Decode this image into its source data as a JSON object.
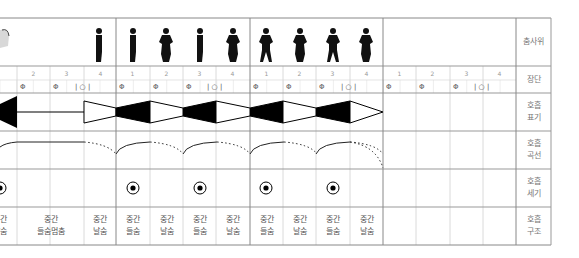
{
  "row_labels": [
    {
      "id": "dance-pose",
      "text": "춤사위"
    },
    {
      "id": "jangdan",
      "text": "장단"
    },
    {
      "id": "breath-notation",
      "text": "호흡\n표기"
    },
    {
      "id": "breath-curve",
      "text": "호흡\n곡선"
    },
    {
      "id": "breath-intensity",
      "text": "호흡\n세기"
    },
    {
      "id": "breath-structure",
      "text": "호흡\n구조"
    }
  ],
  "measures": [
    {
      "beats": [
        "2",
        "3",
        "4"
      ],
      "symbols": [
        "Φ",
        "Φ",
        "| ○ |"
      ]
    },
    {
      "beats": [
        "1",
        "2",
        "3",
        "4"
      ],
      "symbols": [
        "Φ",
        "Φ",
        "Φ",
        "| ○ |"
      ]
    },
    {
      "beats": [
        "1",
        "2",
        "3",
        "4"
      ],
      "symbols": [
        "Φ",
        "Φ",
        "Φ",
        "| ○ |"
      ]
    },
    {
      "beats": [
        "1",
        "2",
        "3",
        "4"
      ],
      "symbols": [
        "Φ",
        "Φ",
        "Φ",
        "| ○ |"
      ]
    }
  ],
  "beat_numbers": [
    {
      "x": 17,
      "t": "2"
    },
    {
      "x": 50,
      "t": "3"
    },
    {
      "x": 84,
      "t": "4"
    },
    {
      "x": 116,
      "t": "1"
    },
    {
      "x": 150,
      "t": "2"
    },
    {
      "x": 183,
      "t": "3"
    },
    {
      "x": 216,
      "t": "4"
    },
    {
      "x": 250,
      "t": "1"
    },
    {
      "x": 283,
      "t": "2"
    },
    {
      "x": 316,
      "t": "3"
    },
    {
      "x": 350,
      "t": "4"
    },
    {
      "x": 383,
      "t": "1"
    },
    {
      "x": 416,
      "t": "2"
    },
    {
      "x": 450,
      "t": "3"
    },
    {
      "x": 483,
      "t": "4"
    }
  ],
  "structure_cells": [
    {
      "x": -17,
      "w": 33,
      "text": "중간\n날숨"
    },
    {
      "x": 17,
      "w": 67,
      "text": "중간\n들숨멈춤"
    },
    {
      "x": 84,
      "w": 32,
      "text": "중간\n날숨"
    },
    {
      "x": 116,
      "w": 34,
      "text": "중간\n들숨"
    },
    {
      "x": 150,
      "w": 33,
      "text": "중간\n날숨"
    },
    {
      "x": 183,
      "w": 33,
      "text": "중간\n들숨"
    },
    {
      "x": 216,
      "w": 34,
      "text": "중간\n날숨"
    },
    {
      "x": 250,
      "w": 33,
      "text": "중간\n들숨"
    },
    {
      "x": 283,
      "w": 33,
      "text": "중간\n날숨"
    },
    {
      "x": 316,
      "w": 34,
      "text": "중간\n들숨"
    },
    {
      "x": 350,
      "w": 33,
      "text": "중간\n날숨"
    }
  ],
  "intensity_marks_x": [
    0,
    133,
    200,
    266,
    333
  ],
  "dancer_figures": [
    {
      "x": 99,
      "pose": "side"
    },
    {
      "x": 133,
      "pose": "side"
    },
    {
      "x": 166,
      "pose": "front-hands-hips"
    },
    {
      "x": 200,
      "pose": "side"
    },
    {
      "x": 233,
      "pose": "front-hands-hips"
    },
    {
      "x": 266,
      "pose": "front-wide"
    },
    {
      "x": 300,
      "pose": "front-hands-hips"
    },
    {
      "x": 333,
      "pose": "front-wide"
    },
    {
      "x": 366,
      "pose": "front-hands-hips"
    }
  ],
  "colors": {
    "grid": "#cccccc",
    "major": "#777777",
    "ink": "#000000",
    "label": "#777777"
  }
}
